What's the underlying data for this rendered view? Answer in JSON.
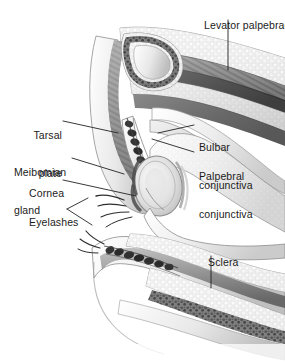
{
  "figure": {
    "type": "anatomical-cross-section",
    "style": "grayscale medical illustration",
    "background_color": "#ffffff",
    "label_color": "#1b1b1b",
    "leader_color": "#222222",
    "width": 285,
    "height": 362
  },
  "labels": {
    "levator_palpebrae": "Levator palpebrae",
    "tarsal_plate_line1": "Tarsal",
    "tarsal_plate_line2": "plate",
    "meibomian_gland_line1": "Meibomian",
    "meibomian_gland_line2": "gland",
    "cornea": "Cornea",
    "eyelashes": "Eyelashes",
    "bulbar_conjunctiva_line1": "Bulbar",
    "bulbar_conjunctiva_line2": "conjunctiva",
    "palpebral_conjunctiva_line1": "Palpebral",
    "palpebral_conjunctiva_line2": "conjunctiva",
    "sclera": "Sclera"
  },
  "structures": [
    "levator palpebrae superioris muscle",
    "superior tarsal plate",
    "meibomian glands",
    "cornea",
    "eyelashes",
    "bulbar conjunctiva",
    "palpebral conjunctiva",
    "sclera",
    "inferior tarsal plate",
    "orbicularis oculi",
    "orbital fat"
  ]
}
